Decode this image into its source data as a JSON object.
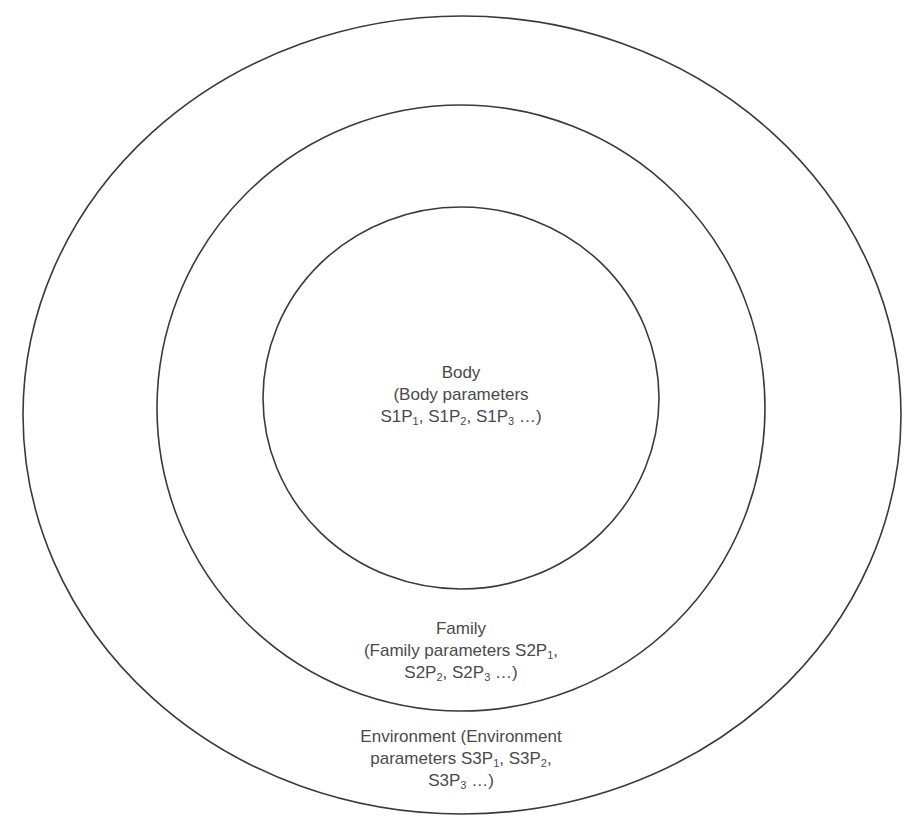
{
  "diagram": {
    "type": "concentric-circles",
    "rings": [
      {
        "id": "environment",
        "name": "Environment",
        "center": [
          462,
          415
        ],
        "rx": 439,
        "ry": 399
      },
      {
        "id": "family",
        "name": "Family",
        "center": [
          461,
          408
        ],
        "rx": 304,
        "ry": 303
      },
      {
        "id": "body",
        "name": "Body",
        "center": [
          461,
          398
        ],
        "rx": 198,
        "ry": 191
      }
    ],
    "stroke_color": "#3a3a3a",
    "text_color": "#4a4a4a"
  },
  "labels": {
    "body": {
      "title": "Body",
      "line2": "(Body parameters",
      "line3_parts": [
        {
          "t": "S1P"
        },
        {
          "s": "1"
        },
        {
          "t": ", S1P"
        },
        {
          "s": "2"
        },
        {
          "t": ", S1P"
        },
        {
          "s": "3"
        },
        {
          "t": " …)"
        }
      ],
      "params": [
        "S1P1",
        "S1P2",
        "S1P3"
      ]
    },
    "family": {
      "title": "Family",
      "line2_text": "(Family parameters S2P",
      "line2_sub": "1",
      "line2_tail": ",",
      "line3_parts": [
        {
          "t": "S2P"
        },
        {
          "s": "2"
        },
        {
          "t": ", S2P"
        },
        {
          "s": "3"
        },
        {
          "t": " …)"
        }
      ],
      "params": [
        "S2P1",
        "S2P2",
        "S2P3"
      ]
    },
    "environment": {
      "line1": "Environment (Environment",
      "line2_parts": [
        {
          "t": "parameters S3P"
        },
        {
          "s": "1"
        },
        {
          "t": ", S3P"
        },
        {
          "s": "2"
        },
        {
          "t": ","
        }
      ],
      "line3_parts": [
        {
          "t": "S3P"
        },
        {
          "s": "3"
        },
        {
          "t": " …)"
        }
      ],
      "params": [
        "S3P1",
        "S3P2",
        "S3P3"
      ]
    }
  }
}
